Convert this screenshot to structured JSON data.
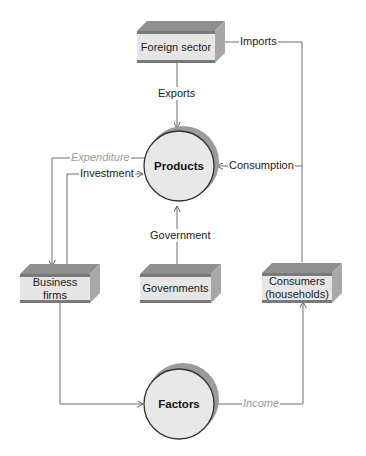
{
  "nodes": {
    "foreign_sector": "Foreign sector",
    "products": "Products",
    "business_firms": "Business firms",
    "governments": "Governments",
    "consumers_line1": "Consumers",
    "consumers_line2": "(households)",
    "factors": "Factors"
  },
  "flows": {
    "imports": "Imports",
    "exports": "Exports",
    "expenditure": "Expenditure",
    "investment": "Investment",
    "consumption": "Consumption",
    "government": "Government",
    "income": "Income"
  },
  "colors": {
    "box_top": "#8f8f8f",
    "box_front": "#e6e6e6",
    "box_side": "#a8a8a8",
    "circle_fill": "#e8e8e8",
    "circle_shadow": "#9a9a9a",
    "line": "#6d6d6d",
    "italic_label": "#9a9a9a"
  }
}
